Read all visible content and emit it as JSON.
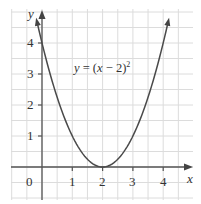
{
  "chart_data": {
    "type": "line",
    "title": "",
    "equation_label": {
      "y": "y",
      "eq": " = (",
      "x": "x",
      "rest": " − 2)",
      "exp": "2"
    },
    "xlabel": "x",
    "ylabel": "y",
    "xlim": [
      -0.5,
      4.9
    ],
    "ylim": [
      -1.0,
      5.0
    ],
    "grid": true,
    "grid_minor_step": 0.5,
    "x_ticks": [
      1,
      2,
      3,
      4
    ],
    "y_ticks": [
      1,
      2,
      3,
      4
    ],
    "origin_label": "0",
    "series": [
      {
        "name": "y = (x − 2)^2",
        "x": [
          -0.2,
          0,
          0.5,
          1,
          1.5,
          2,
          2.5,
          3,
          3.5,
          4,
          4.2
        ],
        "y": [
          4.84,
          4,
          2.25,
          1,
          0.25,
          0,
          0.25,
          1,
          2.25,
          4,
          4.84
        ]
      }
    ],
    "colors": {
      "curve": "#4a4a4a",
      "axes": "#555555",
      "grid": "#dcdcdc",
      "text": "#333333"
    }
  },
  "labels": {
    "tick_x": [
      "1",
      "2",
      "3",
      "4"
    ],
    "tick_y": [
      "1",
      "2",
      "3",
      "4"
    ],
    "origin": "0",
    "x_axis": "x",
    "y_axis": "y"
  }
}
